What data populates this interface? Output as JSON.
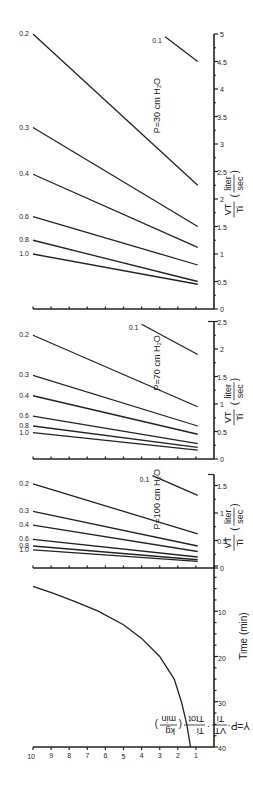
{
  "chart_data": {
    "type": "line",
    "orientation": "rotated-90-ccw",
    "shared_y": {
      "label": "Y = P · VT/Ti · Ti/Ttot (kg/min)",
      "label_parts": {
        "lhs": "Y=P·",
        "f1_num": "VT",
        "f1_den": "Ti",
        "f2_num": "Ti",
        "f2_den": "Ttot",
        "unit_num": "kg",
        "unit_den": "min"
      },
      "ticks": [
        1,
        2,
        3,
        4,
        5,
        6,
        7,
        8,
        9,
        10
      ],
      "ylim": [
        0,
        10
      ]
    },
    "panels": [
      {
        "name": "time",
        "xlabel": "Time (min)",
        "xlim": [
          0,
          40
        ],
        "x_ticks": [
          10,
          20,
          30,
          40
        ],
        "series": [
          {
            "name": "Y vs time",
            "x": [
              4.5,
              6,
              8,
              10,
              13,
              16,
              20,
              25,
              30,
              35,
              40
            ],
            "y": [
              10,
              8.9,
              7.6,
              6.4,
              5.0,
              4.0,
              3.0,
              2.2,
              1.8,
              1.5,
              1.3
            ]
          }
        ]
      },
      {
        "name": "P100",
        "annotation": "P=100 cm H2O",
        "xlabel": "VT/Ti (liter/sec)",
        "xlim": [
          0,
          1.7
        ],
        "x_ticks": [
          0,
          0.5,
          1,
          1.5
        ],
        "series_param": "Ti/Ttot",
        "series": [
          {
            "name": "1.0",
            "x": [
              0.12,
              0.33
            ],
            "y": [
              0.9,
              10
            ]
          },
          {
            "name": "0.8",
            "x": [
              0.15,
              0.4
            ],
            "y": [
              0.9,
              10
            ]
          },
          {
            "name": "0.6",
            "x": [
              0.2,
              0.52
            ],
            "y": [
              0.9,
              10
            ]
          },
          {
            "name": "0.4",
            "x": [
              0.3,
              0.78
            ],
            "y": [
              0.9,
              10
            ]
          },
          {
            "name": "0.3",
            "x": [
              0.4,
              1.03
            ],
            "y": [
              0.9,
              10
            ]
          },
          {
            "name": "0.2",
            "x": [
              0.62,
              1.53
            ],
            "y": [
              0.9,
              10
            ]
          },
          {
            "name": "0.1",
            "x": [
              1.32,
              1.68
            ],
            "y": [
              0.9,
              3.4
            ]
          }
        ]
      },
      {
        "name": "P70",
        "annotation": "P=70 cm H2O",
        "xlabel": "VT/Ti (liter/sec)",
        "xlim": [
          0,
          2.5
        ],
        "x_ticks": [
          0,
          0.5,
          1,
          1.5,
          2,
          2.5
        ],
        "series_param": "Ti/Ttot",
        "series": [
          {
            "name": "1.0",
            "x": [
              0.16,
              0.48
            ],
            "y": [
              0.9,
              10
            ]
          },
          {
            "name": "0.8",
            "x": [
              0.21,
              0.6
            ],
            "y": [
              0.9,
              10
            ]
          },
          {
            "name": "0.6",
            "x": [
              0.28,
              0.78
            ],
            "y": [
              0.9,
              10
            ]
          },
          {
            "name": "0.4",
            "x": [
              0.45,
              1.15
            ],
            "y": [
              0.9,
              10
            ]
          },
          {
            "name": "0.3",
            "x": [
              0.6,
              1.52
            ],
            "y": [
              0.9,
              10
            ]
          },
          {
            "name": "0.2",
            "x": [
              0.95,
              2.25
            ],
            "y": [
              0.9,
              10
            ]
          },
          {
            "name": "0.1",
            "x": [
              1.9,
              2.45
            ],
            "y": [
              0.9,
              4.0
            ]
          }
        ]
      },
      {
        "name": "P30",
        "annotation": "P=30 cm H2O",
        "xlabel": "VT/Ti (liter/sec)",
        "xlim": [
          0,
          5
        ],
        "x_ticks": [
          0,
          0.5,
          1,
          1.5,
          2,
          2.5,
          3,
          3.5,
          4,
          4.5,
          5
        ],
        "series_param": "Ti/Ttot",
        "series": [
          {
            "name": "1.0",
            "x": [
              0.45,
              1.0
            ],
            "y": [
              0.9,
              10
            ]
          },
          {
            "name": "0.8",
            "x": [
              0.5,
              1.25
            ],
            "y": [
              0.9,
              10
            ]
          },
          {
            "name": "0.6",
            "x": [
              0.8,
              1.68
            ],
            "y": [
              0.9,
              10
            ]
          },
          {
            "name": "0.4",
            "x": [
              1.12,
              2.45
            ],
            "y": [
              0.9,
              10
            ]
          },
          {
            "name": "0.3",
            "x": [
              1.5,
              3.3
            ],
            "y": [
              0.9,
              10
            ]
          },
          {
            "name": "0.2",
            "x": [
              2.25,
              5.0
            ],
            "y": [
              0.9,
              10
            ]
          },
          {
            "name": "0.1",
            "x": [
              4.5,
              4.95
            ],
            "y": [
              0.9,
              2.7
            ]
          }
        ]
      }
    ]
  },
  "labels": {
    "time_axis": "Time (min)",
    "flow_num": "VT",
    "flow_den": "Ti",
    "flow_unit_num": "liter",
    "flow_unit_den": "sec",
    "p100": "P=100 cm H₂O",
    "p70": "P=70 cm H₂O",
    "p30": "P=30 cm H₂O",
    "y_lhs": "Y=P·",
    "y_vt": "VT",
    "y_ti": "Ti",
    "y_ti2": "Ti",
    "y_ttot": "Ttot",
    "y_kg": "kg",
    "y_min": "min"
  }
}
